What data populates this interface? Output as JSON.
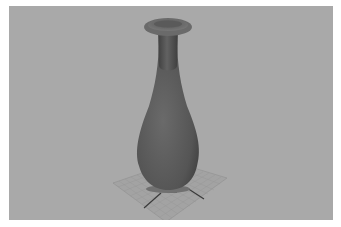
{
  "viewport": {
    "background": "#a9a9a9",
    "object": "vase",
    "vase_color": "#5a5a5a",
    "grid_color": "#8f8f8f",
    "axis_color": "#3a3a3a"
  }
}
